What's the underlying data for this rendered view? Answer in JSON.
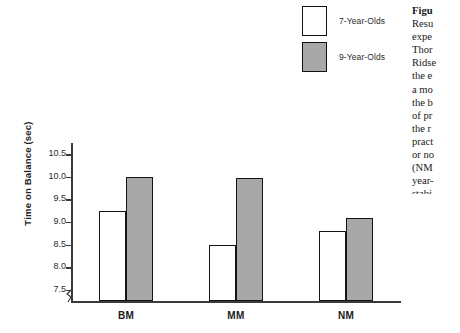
{
  "chart_data": {
    "type": "bar",
    "title": "",
    "xlabel": "",
    "ylabel": "Time on Balance (sec)",
    "categories": [
      "BM",
      "MM",
      "NM"
    ],
    "series": [
      {
        "name": "7-Year-Olds",
        "color": "#ffffff",
        "values": [
          9.25,
          8.5,
          8.8
        ]
      },
      {
        "name": "9-Year-Olds",
        "color": "#a8a8a8",
        "values": [
          10.0,
          9.98,
          9.1
        ]
      }
    ],
    "ylim": [
      7.25,
      10.75
    ],
    "yticks": [
      "7.5",
      "8.0",
      "8.5",
      "9.0",
      "9.5",
      "10.0",
      "10.5"
    ],
    "ytick_values": [
      7.5,
      8.0,
      8.5,
      9.0,
      9.5,
      10.0,
      10.5
    ],
    "grid": false,
    "legend_position": "top-right",
    "axis_break": true
  },
  "legend": {
    "items": [
      {
        "label": "7-Year-Olds",
        "swatch": "white-swatch"
      },
      {
        "label": "9-Year-Olds",
        "swatch": "gray-swatch"
      }
    ]
  },
  "caption": {
    "lines": [
      "Figu",
      "Resu",
      "expe",
      "Thor",
      "Ridse",
      "the e",
      "a mo",
      "the b",
      "of pr",
      "the r",
      "pract",
      "or no",
      "(NM",
      "year-",
      "stabi"
    ]
  }
}
